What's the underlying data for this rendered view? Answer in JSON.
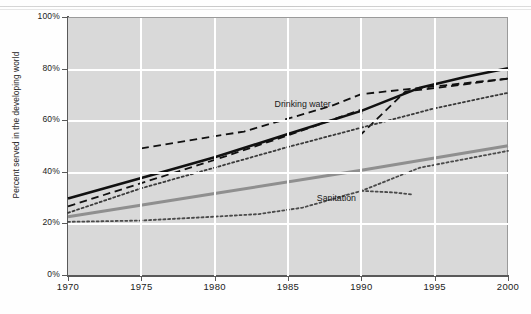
{
  "chart_data": {
    "type": "line",
    "title": "",
    "subtitle": "",
    "xlabel": "",
    "ylabel": "Percent served in the developing world",
    "xlim": [
      1970,
      2000
    ],
    "ylim": [
      0,
      100
    ],
    "grid": true,
    "legend": "none",
    "x_ticks": [
      "1970",
      "1975",
      "1980",
      "1985",
      "1990",
      "1995",
      "2000"
    ],
    "x_tick_values": [
      1970,
      1975,
      1980,
      1985,
      1990,
      1995,
      2000
    ],
    "y_ticks": [
      "0%",
      "20%",
      "40%",
      "60%",
      "80%",
      "100%"
    ],
    "y_tick_values": [
      0,
      20,
      40,
      60,
      80,
      100
    ],
    "annotations": [
      {
        "text": "Drinking water",
        "x": 1986,
        "y": 66
      },
      {
        "text": "Sanitation",
        "x": 1988.3,
        "y": 29.5
      }
    ],
    "series": [
      {
        "name": "Drinking water (trend)",
        "style": "solid",
        "color": "#111111",
        "width": 2.6,
        "points": [
          {
            "x": 1970,
            "y": 30
          },
          {
            "x": 1975,
            "y": 38
          },
          {
            "x": 1980,
            "y": 46
          },
          {
            "x": 1985,
            "y": 55
          },
          {
            "x": 1990,
            "y": 64
          },
          {
            "x": 1994,
            "y": 73
          },
          {
            "x": 1997,
            "y": 77
          },
          {
            "x": 2000,
            "y": 80.5
          }
        ]
      },
      {
        "name": "Drinking water (dashed estimate A)",
        "style": "dashed",
        "color": "#111111",
        "width": 1.8,
        "points": [
          {
            "x": 1970,
            "y": 27
          },
          {
            "x": 1975,
            "y": 36
          },
          {
            "x": 1980,
            "y": 45
          },
          {
            "x": 1985,
            "y": 54.5
          },
          {
            "x": 1990,
            "y": 64.5
          },
          {
            "x": 1990,
            "y": 55
          },
          {
            "x": 1993,
            "y": 71.5
          },
          {
            "x": 1996,
            "y": 73.5
          },
          {
            "x": 2000,
            "y": 76.5
          }
        ]
      },
      {
        "name": "Drinking water (dashed estimate B)",
        "style": "dashed",
        "color": "#111111",
        "width": 1.8,
        "points": [
          {
            "x": 1975,
            "y": 49.5
          },
          {
            "x": 1982,
            "y": 56
          },
          {
            "x": 1988,
            "y": 66
          },
          {
            "x": 1990,
            "y": 70.5
          },
          {
            "x": 1995,
            "y": 73.5
          },
          {
            "x": 2000,
            "y": 76.5
          }
        ]
      },
      {
        "name": "Drinking water (dotted estimate)",
        "style": "dotted",
        "color": "#3a3a3a",
        "width": 1.8,
        "points": [
          {
            "x": 1970,
            "y": 24.5
          },
          {
            "x": 1975,
            "y": 34
          },
          {
            "x": 1980,
            "y": 42
          },
          {
            "x": 1985,
            "y": 50
          },
          {
            "x": 1990,
            "y": 57.5
          },
          {
            "x": 1995,
            "y": 65
          },
          {
            "x": 2000,
            "y": 71
          }
        ]
      },
      {
        "name": "Sanitation (trend)",
        "style": "solid",
        "color": "#8f8f8f",
        "width": 3.0,
        "points": [
          {
            "x": 1970,
            "y": 23
          },
          {
            "x": 1980,
            "y": 32
          },
          {
            "x": 1990,
            "y": 41
          },
          {
            "x": 2000,
            "y": 50.5
          }
        ]
      },
      {
        "name": "Sanitation (dotted estimate)",
        "style": "dotted",
        "color": "#4a4a4a",
        "width": 1.8,
        "points": [
          {
            "x": 1970,
            "y": 21
          },
          {
            "x": 1975,
            "y": 21.5
          },
          {
            "x": 1980,
            "y": 23
          },
          {
            "x": 1983,
            "y": 24
          },
          {
            "x": 1986,
            "y": 26.5
          },
          {
            "x": 1990,
            "y": 33
          },
          {
            "x": 1994,
            "y": 42
          },
          {
            "x": 2000,
            "y": 48.5
          }
        ]
      },
      {
        "name": "Sanitation (1990 dotted segment)",
        "style": "dotted",
        "color": "#4a4a4a",
        "width": 1.8,
        "points": [
          {
            "x": 1990,
            "y": 33
          },
          {
            "x": 1992.2,
            "y": 32.4
          },
          {
            "x": 1993.5,
            "y": 31.6
          }
        ]
      }
    ]
  }
}
